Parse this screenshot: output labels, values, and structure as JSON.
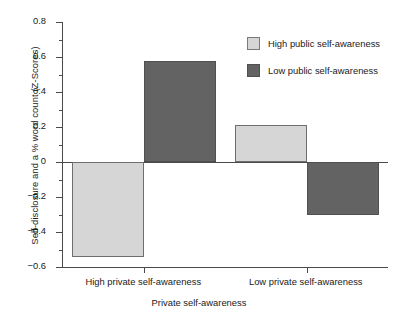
{
  "chart_data": {
    "type": "bar",
    "title": "",
    "xlabel": "Private self-awareness",
    "ylabel": "Self-disclosure and a % word count (Z-Scores)",
    "categories": [
      "High private self-awareness",
      "Low private self-awareness"
    ],
    "series": [
      {
        "name": "High public self-awareness",
        "values": [
          -0.54,
          0.21
        ],
        "color": "#d6d6d6"
      },
      {
        "name": "Low public self-awareness",
        "values": [
          0.58,
          -0.3
        ],
        "color": "#636363"
      }
    ],
    "ylim": [
      -0.6,
      0.8
    ],
    "yticks": [
      0.8,
      0.6,
      0.4,
      0.2,
      0,
      -0.2,
      -0.4,
      -0.6
    ],
    "ytick_labels": [
      "0.8",
      "0.6",
      "0.4",
      "0.2",
      "0",
      "−0.2",
      "−0.4",
      "−0.6"
    ],
    "yminor_ticks": [
      0.7,
      0.5,
      0.3,
      0.1,
      -0.1,
      -0.3,
      -0.5
    ],
    "grid": false,
    "legend_position": "top-right",
    "zero_line": 0
  },
  "legend": {
    "entries": [
      {
        "label": "High public self-awareness"
      },
      {
        "label": "Low public self-awareness"
      }
    ]
  }
}
